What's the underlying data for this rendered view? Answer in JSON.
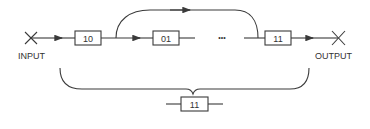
{
  "diagram": {
    "input_label": "INPUT",
    "output_label": "OUTPUT",
    "chain_boxes": [
      {
        "label": "10"
      },
      {
        "label": "01"
      },
      {
        "label": "11"
      }
    ],
    "ellipsis": "•••",
    "equivalent_box": {
      "label": "11"
    },
    "colors": {
      "line": "#3a3a3a",
      "text": "#333333",
      "background": "#ffffff"
    }
  }
}
